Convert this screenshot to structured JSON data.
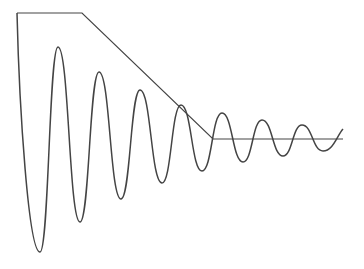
{
  "diagram": {
    "stroke_color": "#444444",
    "envelope_line": {
      "points": [
        [
          17,
          13
        ],
        [
          82,
          13
        ],
        [
          213,
          139
        ],
        [
          343,
          139
        ]
      ]
    },
    "oscillation": {
      "start": [
        17,
        13
      ],
      "midline_y": 139,
      "extrema": [
        [
          40,
          252
        ],
        [
          58,
          47
        ],
        [
          80,
          222
        ],
        [
          99,
          72
        ],
        [
          121,
          199
        ],
        [
          140,
          90
        ],
        [
          162,
          183
        ],
        [
          181,
          105
        ],
        [
          202,
          171
        ],
        [
          222,
          113
        ],
        [
          243,
          162
        ],
        [
          262,
          120
        ],
        [
          283,
          156
        ],
        [
          302,
          125
        ],
        [
          323,
          151
        ]
      ],
      "end": [
        343,
        129
      ]
    }
  }
}
